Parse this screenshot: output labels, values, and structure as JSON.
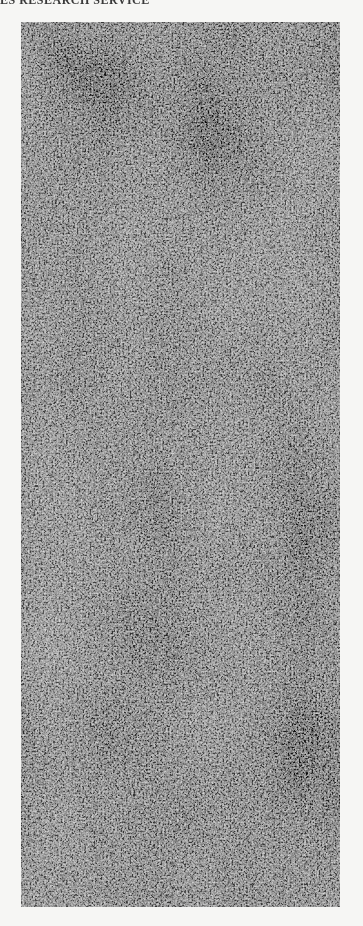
{
  "page": {
    "header_text": "ES RESEARCH SERVICE",
    "background_color": "#f6f6f4"
  },
  "figure": {
    "base_color": "#3a3a3a",
    "filament_color": "#f0f0f0",
    "caption": ""
  }
}
